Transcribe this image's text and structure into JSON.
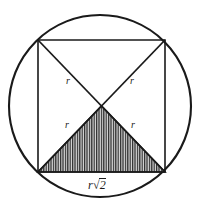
{
  "figure": {
    "colors": {
      "stroke": "#1a1a1a",
      "background": "#ffffff",
      "hatch": "#2b2b2b",
      "hatch_fill": "#d8d8d8"
    },
    "circle": {
      "cx": 100,
      "cy": 106,
      "r": 91,
      "stroke_width": 2.1
    },
    "square": {
      "corners": [
        {
          "name": "top-left",
          "x": 38,
          "y": 40
        },
        {
          "name": "top-right",
          "x": 165,
          "y": 40
        },
        {
          "name": "bottom-right",
          "x": 165,
          "y": 172
        },
        {
          "name": "bottom-left",
          "x": 38,
          "y": 172
        }
      ],
      "stroke_width": 1.5
    },
    "center_point": {
      "x": 101.5,
      "y": 106
    },
    "shaded_triangle": {
      "points": [
        {
          "x": 38,
          "y": 172
        },
        {
          "x": 165,
          "y": 172
        },
        {
          "x": 101.5,
          "y": 106
        }
      ],
      "hatch_style": "vertical-lines",
      "hatch_spacing": 2.4
    },
    "labels": {
      "radius_upper_left": {
        "text": "r",
        "x": 66,
        "y": 76
      },
      "radius_upper_right": {
        "text": "r",
        "x": 130,
        "y": 76
      },
      "radius_lower_left": {
        "text": "r",
        "x": 65,
        "y": 120
      },
      "radius_lower_right": {
        "text": "r",
        "x": 131,
        "y": 120
      },
      "base": {
        "prefix": "r",
        "radical_symbol": "√",
        "radicand": "2",
        "full_text": "r√2",
        "x": 88,
        "y": 178
      }
    }
  }
}
